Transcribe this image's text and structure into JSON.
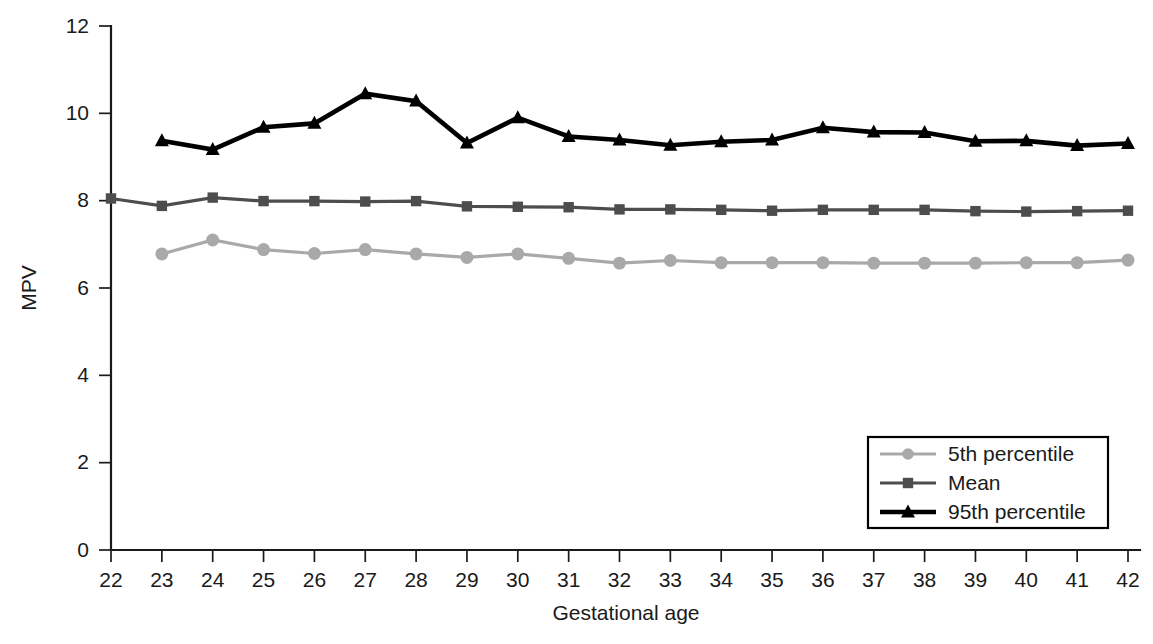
{
  "chart_data": {
    "type": "line",
    "title": "",
    "xlabel": "Gestational age",
    "ylabel": "MPV",
    "xlim": [
      22,
      42
    ],
    "ylim": [
      0,
      12
    ],
    "xticks": [
      22,
      23,
      24,
      25,
      26,
      27,
      28,
      29,
      30,
      31,
      32,
      33,
      34,
      35,
      36,
      37,
      38,
      39,
      40,
      41,
      42
    ],
    "yticks": [
      0,
      2,
      4,
      6,
      8,
      10,
      12
    ],
    "grid": false,
    "legend_position": "bottom-right",
    "x": [
      22,
      23,
      24,
      25,
      26,
      27,
      28,
      29,
      30,
      31,
      32,
      33,
      34,
      35,
      36,
      37,
      38,
      39,
      40,
      41,
      42
    ],
    "series": [
      {
        "name": "5th percentile",
        "color": "#a9a9a9",
        "marker": "circle",
        "x": [
          23,
          24,
          25,
          26,
          27,
          28,
          29,
          30,
          31,
          32,
          33,
          34,
          35,
          36,
          37,
          38,
          39,
          40,
          41,
          42
        ],
        "values": [
          6.78,
          7.1,
          6.88,
          6.79,
          6.88,
          6.78,
          6.7,
          6.78,
          6.68,
          6.57,
          6.63,
          6.58,
          6.58,
          6.58,
          6.57,
          6.57,
          6.57,
          6.58,
          6.58,
          6.64
        ]
      },
      {
        "name": "Mean",
        "color": "#4d4d4d",
        "marker": "square",
        "x": [
          22,
          23,
          24,
          25,
          26,
          27,
          28,
          29,
          30,
          31,
          32,
          33,
          34,
          35,
          36,
          37,
          38,
          39,
          40,
          41,
          42
        ],
        "values": [
          8.05,
          7.88,
          8.07,
          7.99,
          7.99,
          7.98,
          7.99,
          7.87,
          7.86,
          7.85,
          7.8,
          7.8,
          7.79,
          7.77,
          7.79,
          7.79,
          7.79,
          7.76,
          7.75,
          7.76,
          7.77
        ]
      },
      {
        "name": "95th percentile",
        "color": "#000000",
        "marker": "triangle",
        "x": [
          23,
          24,
          25,
          26,
          27,
          28,
          29,
          30,
          31,
          32,
          33,
          34,
          35,
          36,
          37,
          38,
          39,
          40,
          41,
          42
        ],
        "values": [
          9.37,
          9.17,
          9.68,
          9.77,
          10.45,
          10.28,
          9.32,
          9.9,
          9.47,
          9.39,
          9.27,
          9.35,
          9.39,
          9.67,
          9.57,
          9.56,
          9.36,
          9.37,
          9.26,
          9.31
        ]
      }
    ],
    "legend": [
      {
        "label": "5th percentile",
        "color": "#a9a9a9",
        "marker": "circle"
      },
      {
        "label": "Mean",
        "color": "#4d4d4d",
        "marker": "square"
      },
      {
        "label": "95th percentile",
        "color": "#000000",
        "marker": "triangle"
      }
    ]
  },
  "axes": {
    "y_title": "MPV",
    "x_title": "Gestational age"
  }
}
